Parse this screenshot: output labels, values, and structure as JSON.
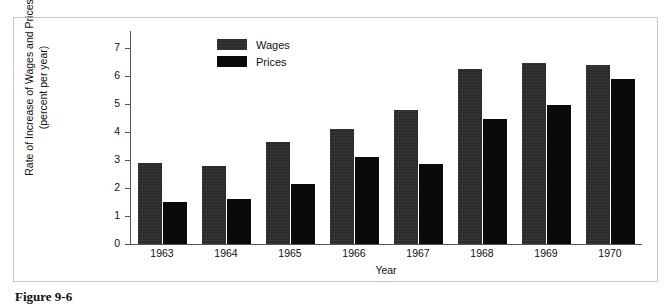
{
  "figure": {
    "caption": "Figure 9-6"
  },
  "legend": {
    "position": "top-center-left",
    "entries": [
      {
        "label": "Wages",
        "color": "#2b2b2b"
      },
      {
        "label": "Prices",
        "color": "#090909"
      }
    ]
  },
  "chart_data": {
    "type": "bar",
    "title": "",
    "xlabel": "Year",
    "ylabel": "Rate of Increase of Wages and Prices\n(percent per year)",
    "categories": [
      "1963",
      "1964",
      "1965",
      "1966",
      "1967",
      "1968",
      "1969",
      "1970"
    ],
    "series": [
      {
        "name": "Wages",
        "color": "#2b2b2b",
        "values": [
          2.9,
          2.8,
          3.65,
          4.1,
          4.8,
          6.25,
          6.45,
          6.4
        ]
      },
      {
        "name": "Prices",
        "color": "#090909",
        "values": [
          1.5,
          1.6,
          2.15,
          3.1,
          2.85,
          4.45,
          4.95,
          5.9
        ]
      }
    ],
    "ylim": [
      0,
      7.6
    ],
    "yticks": [
      0,
      1,
      2,
      3,
      4,
      5,
      6,
      7
    ],
    "ytick_labels": [
      "0",
      "1",
      "2",
      "3",
      "4",
      "5",
      "6",
      "7"
    ],
    "grid": false,
    "legend_position": "upper left of plot"
  }
}
